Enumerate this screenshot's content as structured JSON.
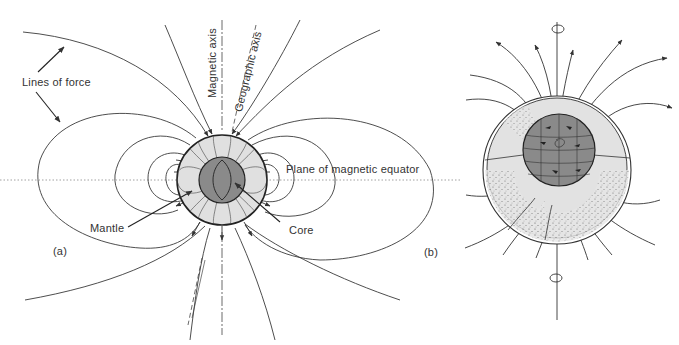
{
  "panel_a": {
    "label": "(a)",
    "labels": {
      "lines_of_force": "Lines of force",
      "magnetic_axis": "Magnetic axis",
      "geographic_axis": "Geographic axis",
      "magnetic_equator": "Plane of magnetic equator",
      "mantle": "Mantle",
      "core": "Core"
    }
  },
  "panel_b": {
    "label": "(b)"
  },
  "colors": {
    "line": "#3a3a3a",
    "mantle_fill": "#e0e0e0",
    "core_fill": "#8a8a8a",
    "background": "#ffffff"
  }
}
